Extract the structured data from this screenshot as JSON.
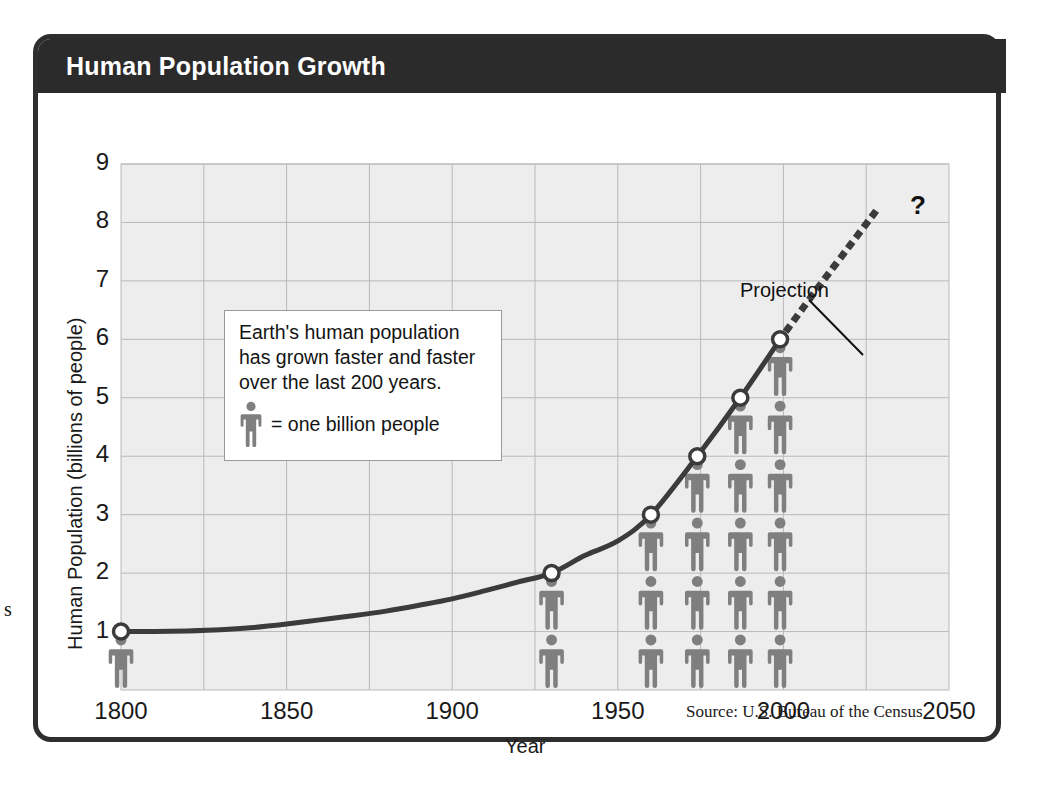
{
  "figure": {
    "title": "Human Population Growth",
    "source_note": "Source: U.S. Bureau of the Census",
    "margin_letter": "s",
    "colors": {
      "title_bar": "#2b2b2b",
      "frame_border": "#2e2e2e",
      "plot_background": "#ededed",
      "grid_line": "#b9b9b9",
      "curve": "#3b3b3b",
      "marker_fill": "#ffffff",
      "person_icon": "#7f7f7f",
      "text": "#1a1a1a"
    }
  },
  "callout": {
    "line1": "Earth's human population",
    "line2": "has grown faster and faster",
    "line3": "over the last 200 years.",
    "legend_label": "= one billion people"
  },
  "annotations": {
    "projection_label": "Projection",
    "question_mark": "?"
  },
  "chart_data": {
    "type": "line",
    "title": "Human Population Growth",
    "xlabel": "Year",
    "ylabel": "Human Population (billions of people)",
    "xlim": [
      1800,
      2050
    ],
    "ylim": [
      0,
      9
    ],
    "xticks": [
      1800,
      1850,
      1900,
      1950,
      2000,
      2050
    ],
    "xtick_labels": [
      "1800",
      "1850",
      "1900",
      "1950",
      "2000",
      "2050"
    ],
    "yticks": [
      1,
      2,
      3,
      4,
      5,
      6,
      7,
      8,
      9
    ],
    "ytick_labels": [
      "1",
      "2",
      "3",
      "4",
      "5",
      "6",
      "7",
      "8",
      "9"
    ],
    "grid": true,
    "grid_x_step": 25,
    "grid_y_step": 1,
    "legend_position": "inset-left",
    "series": [
      {
        "name": "Historical population",
        "style": "solid",
        "x": [
          1800,
          1810,
          1820,
          1830,
          1840,
          1850,
          1860,
          1870,
          1880,
          1890,
          1900,
          1910,
          1920,
          1930,
          1940,
          1950,
          1960,
          1974,
          1987,
          1999
        ],
        "values": [
          1.0,
          1.0,
          1.01,
          1.03,
          1.07,
          1.13,
          1.2,
          1.27,
          1.35,
          1.45,
          1.56,
          1.7,
          1.85,
          2.0,
          2.3,
          2.55,
          3.0,
          4.0,
          5.0,
          6.0
        ]
      },
      {
        "name": "Projection",
        "style": "dotted",
        "x": [
          1999,
          2010,
          2020,
          2028
        ],
        "values": [
          6.0,
          6.85,
          7.6,
          8.2
        ]
      }
    ],
    "markers": [
      {
        "x": 1800,
        "y": 1,
        "label": "1800: 1 billion"
      },
      {
        "x": 1930,
        "y": 2,
        "label": "1930: 2 billion"
      },
      {
        "x": 1960,
        "y": 3,
        "label": "1960: 3 billion"
      },
      {
        "x": 1974,
        "y": 4,
        "label": "1974: 4 billion"
      },
      {
        "x": 1987,
        "y": 5,
        "label": "1987: 5 billion"
      },
      {
        "x": 1999,
        "y": 6,
        "label": "1999: 6 billion"
      }
    ],
    "pictogram": {
      "unit_label": "one billion people",
      "stacks": [
        {
          "x": 1800,
          "count": 1
        },
        {
          "x": 1930,
          "count": 2
        },
        {
          "x": 1960,
          "count": 3
        },
        {
          "x": 1974,
          "count": 4
        },
        {
          "x": 1987,
          "count": 5
        },
        {
          "x": 1999,
          "count": 6
        }
      ]
    }
  }
}
